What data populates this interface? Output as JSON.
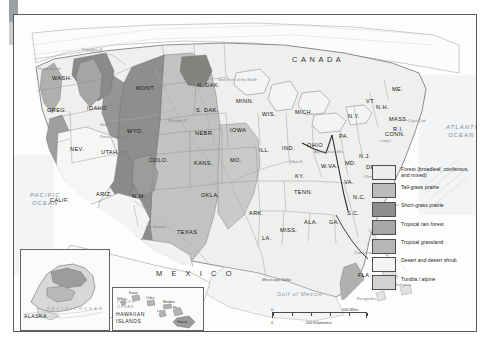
{
  "map": {
    "title": "Natural vegetation regions of the United States",
    "countries": [
      {
        "name": "CANADA",
        "x": 278,
        "y": 41
      },
      {
        "name": "M E X I C O",
        "x": 142,
        "y": 255
      }
    ],
    "oceans": [
      {
        "name": "PACIFIC",
        "x": 16,
        "y": 178
      },
      {
        "name": "OCEAN",
        "x": 18,
        "y": 186
      },
      {
        "name": "ATLANTIC",
        "x": 432,
        "y": 110
      },
      {
        "name": "OCEAN",
        "x": 434,
        "y": 118
      },
      {
        "name": "Gulf of Mexico",
        "x": 263,
        "y": 277
      }
    ],
    "states": [
      {
        "label": "WASH.",
        "x": 38,
        "y": 61
      },
      {
        "label": "OREG.",
        "x": 33,
        "y": 93
      },
      {
        "label": "IDAHO",
        "x": 73,
        "y": 91
      },
      {
        "label": "MONT.",
        "x": 122,
        "y": 71
      },
      {
        "label": "N. DAK.",
        "x": 183,
        "y": 68
      },
      {
        "label": "S. DAK.",
        "x": 182,
        "y": 93
      },
      {
        "label": "MINN.",
        "x": 222,
        "y": 84
      },
      {
        "label": "WIS.",
        "x": 248,
        "y": 97
      },
      {
        "label": "MICH.",
        "x": 281,
        "y": 95
      },
      {
        "label": "WYO.",
        "x": 113,
        "y": 114
      },
      {
        "label": "NEBR.",
        "x": 181,
        "y": 116
      },
      {
        "label": "IOWA",
        "x": 216,
        "y": 113
      },
      {
        "label": "NEV.",
        "x": 56,
        "y": 132
      },
      {
        "label": "UTAH",
        "x": 87,
        "y": 135
      },
      {
        "label": "COLO.",
        "x": 135,
        "y": 143
      },
      {
        "label": "KANS.",
        "x": 180,
        "y": 146
      },
      {
        "label": "MO.",
        "x": 216,
        "y": 143
      },
      {
        "label": "ILL.",
        "x": 245,
        "y": 133
      },
      {
        "label": "IND.",
        "x": 268,
        "y": 131
      },
      {
        "label": "OHIO",
        "x": 293,
        "y": 128
      },
      {
        "label": "PA.",
        "x": 325,
        "y": 119
      },
      {
        "label": "N.Y.",
        "x": 334,
        "y": 99
      },
      {
        "label": "VT.",
        "x": 352,
        "y": 84
      },
      {
        "label": "N.H.",
        "x": 362,
        "y": 90
      },
      {
        "label": "ME.",
        "x": 378,
        "y": 72
      },
      {
        "label": "MASS.",
        "x": 375,
        "y": 102
      },
      {
        "label": "R.I.",
        "x": 379,
        "y": 112
      },
      {
        "label": "CONN.",
        "x": 371,
        "y": 117
      },
      {
        "label": "N.J.",
        "x": 345,
        "y": 139
      },
      {
        "label": "DEL.",
        "x": 352,
        "y": 150
      },
      {
        "label": "MD.",
        "x": 331,
        "y": 146
      },
      {
        "label": "W.VA.",
        "x": 307,
        "y": 149
      },
      {
        "label": "VA.",
        "x": 330,
        "y": 165
      },
      {
        "label": "KY.",
        "x": 281,
        "y": 159
      },
      {
        "label": "TENN.",
        "x": 280,
        "y": 175
      },
      {
        "label": "N.C.",
        "x": 339,
        "y": 180
      },
      {
        "label": "S.C.",
        "x": 333,
        "y": 196
      },
      {
        "label": "GA.",
        "x": 315,
        "y": 205
      },
      {
        "label": "ALA.",
        "x": 290,
        "y": 205
      },
      {
        "label": "MISS.",
        "x": 266,
        "y": 213
      },
      {
        "label": "ARK.",
        "x": 235,
        "y": 196
      },
      {
        "label": "LA.",
        "x": 248,
        "y": 221
      },
      {
        "label": "OKLA.",
        "x": 187,
        "y": 178
      },
      {
        "label": "TEXAS",
        "x": 163,
        "y": 215
      },
      {
        "label": "N.M.",
        "x": 118,
        "y": 179
      },
      {
        "label": "ARIZ.",
        "x": 82,
        "y": 177
      },
      {
        "label": "CALIF.",
        "x": 36,
        "y": 183
      },
      {
        "label": "FLA.",
        "x": 344,
        "y": 258
      }
    ],
    "features": [
      {
        "label": "Columbia R.",
        "x": 68,
        "y": 33
      },
      {
        "label": "Puget Sound",
        "x": 24,
        "y": 52
      },
      {
        "label": "Red River of the North",
        "x": 204,
        "y": 63
      },
      {
        "label": "Missouri R.",
        "x": 154,
        "y": 104
      },
      {
        "label": "Snake R.",
        "x": 86,
        "y": 108
      },
      {
        "label": "Great Salt Lake",
        "x": 86,
        "y": 120
      },
      {
        "label": "Ohio R.",
        "x": 276,
        "y": 145
      },
      {
        "label": "Appalachian Mts.",
        "x": 300,
        "y": 135
      },
      {
        "label": "Chesapeake Bay",
        "x": 350,
        "y": 160
      },
      {
        "label": "Cape Cod",
        "x": 394,
        "y": 104
      },
      {
        "label": "Long I.",
        "x": 366,
        "y": 124
      },
      {
        "label": "Cape Hatteras",
        "x": 360,
        "y": 188
      },
      {
        "label": "Rio Grande",
        "x": 132,
        "y": 210
      },
      {
        "label": "Mississippi Delta",
        "x": 248,
        "y": 263
      },
      {
        "label": "Continental Shelf",
        "x": 340,
        "y": 236
      },
      {
        "label": "Everglades",
        "x": 343,
        "y": 282
      },
      {
        "label": "Bahamas",
        "x": 381,
        "y": 268
      }
    ],
    "labels_misc": [
      {
        "label": "CONTINENTAL DIVIDE",
        "x": 356,
        "y": 214
      }
    ]
  },
  "legend": {
    "items": [
      {
        "label": "Forest (broadleaf, coniferous, and mixed)",
        "color": "#ececea",
        "key": "forest"
      },
      {
        "label": "Tall-grass prairie",
        "color": "#bcbcba",
        "key": "tall-grass-prairie"
      },
      {
        "label": "Short-grass prairie",
        "color": "#8e8e8c",
        "key": "short-grass-prairie"
      },
      {
        "label": "Tropical rain forest",
        "color": "#a8a8a6",
        "key": "tropical-rain-forest"
      },
      {
        "label": "Tropical grassland",
        "color": "#b6b6b4",
        "key": "tropical-grassland"
      },
      {
        "label": "Desert and desert shrub",
        "color": "#f4f4f2",
        "key": "desert-and-desert-shrub"
      },
      {
        "label": "Tundra / alpine",
        "color": "#d2d2d0",
        "key": "tundra-alpine"
      }
    ]
  },
  "scale": {
    "miles_start": "0",
    "miles_end": "500 Miles",
    "km_start": "0",
    "km_end": "500 Kilometers"
  },
  "insets": {
    "alaska": {
      "title": "ALASKA",
      "ocean": "P A C I F I C   O C E A N"
    },
    "hawaii": {
      "title_line1": "HAWAIIAN",
      "title_line2": "ISLANDS",
      "ocean_line1": "PACIFIC",
      "ocean_line2": "OCEAN",
      "islands": [
        {
          "label": "Niihau",
          "x": 4,
          "y": 10
        },
        {
          "label": "Kauai",
          "x": 16,
          "y": 4
        },
        {
          "label": "Oahu",
          "x": 33,
          "y": 9
        },
        {
          "label": "Molokai",
          "x": 50,
          "y": 13
        },
        {
          "label": "Lanai",
          "x": 44,
          "y": 22
        },
        {
          "label": "Maui",
          "x": 60,
          "y": 19
        },
        {
          "label": "Hawaii",
          "x": 64,
          "y": 33
        }
      ]
    }
  }
}
